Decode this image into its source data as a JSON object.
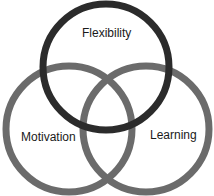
{
  "diagram": {
    "type": "venn",
    "circles": [
      {
        "id": "motivation",
        "label": "Motivation",
        "cx": 69,
        "cy": 129,
        "r": 63,
        "stroke": "#6b6b6b",
        "stroke_width": 7
      },
      {
        "id": "learning",
        "label": "Learning",
        "cx": 146,
        "cy": 129,
        "r": 63,
        "stroke": "#6b6b6b",
        "stroke_width": 7
      },
      {
        "id": "flexibility",
        "label": "Flexibility",
        "cx": 106,
        "cy": 67,
        "r": 63,
        "stroke": "#2b2b2b",
        "stroke_width": 7
      }
    ]
  }
}
